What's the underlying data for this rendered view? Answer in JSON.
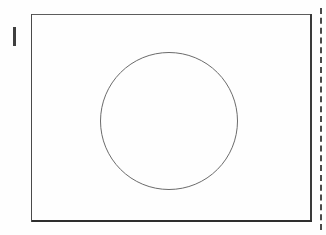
{
  "figure": {
    "kind": "line-drawing",
    "background_color": "#fefefe",
    "ink_color": "#3b3b3b"
  },
  "frame": {
    "name": "rectangle-frame",
    "x": 31,
    "y": 14,
    "width": 281,
    "height": 208,
    "stroke_color": "#3b3b3b",
    "edges": {
      "top": {
        "stroke_color": "#5c5c5c",
        "stroke_width": 1
      },
      "bottom": {
        "stroke_color": "#2e2e2e",
        "stroke_width": 2
      },
      "left": {
        "stroke_color": "#4a4a4a",
        "stroke_width": 1
      },
      "right": {
        "stroke_color": "#3a3a3a",
        "stroke_width": 2
      }
    }
  },
  "circle": {
    "name": "circle-outline",
    "center_x": 169,
    "center_y": 121,
    "radius": 69,
    "stroke_color": "#6b6b6b",
    "stroke_width": 1,
    "fill": "none"
  },
  "tick_mark": {
    "name": "left-tick-mark",
    "x": 13,
    "y": 27,
    "width": 3,
    "height": 19,
    "color": "#3f3f3f"
  },
  "margin_rule": {
    "name": "right-margin-dashed-rule",
    "x": 320,
    "y": 8,
    "height": 222,
    "style": "dashed",
    "stroke_width": 2,
    "color": "#4a4a4a"
  }
}
